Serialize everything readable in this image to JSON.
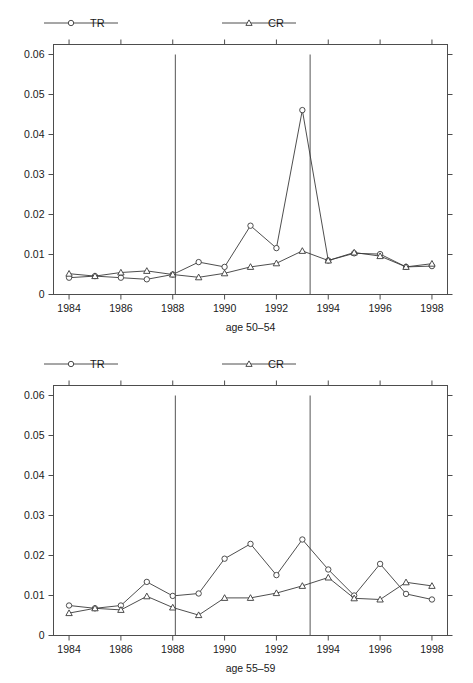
{
  "figure": {
    "background": "#ffffff",
    "line_color": "#3a3a3a",
    "axis_color": "#4d4d4d",
    "text_color": "#1a1a1a"
  },
  "legend": {
    "series": [
      {
        "key": "TR",
        "label": "TR",
        "marker": "circle"
      },
      {
        "key": "CR",
        "label": "CR",
        "marker": "triangle"
      }
    ]
  },
  "chart_data": [
    {
      "id": "age-50-54",
      "type": "line",
      "title": "",
      "xlabel": "age 50–54",
      "ylabel": "",
      "xlim": [
        1983.4,
        1998.6
      ],
      "ylim": [
        0,
        0.0625
      ],
      "xticks": [
        1984,
        1986,
        1988,
        1990,
        1992,
        1994,
        1996,
        1998
      ],
      "xticklabels": [
        "1984",
        "1986",
        "1988",
        "1990",
        "1992",
        "1994",
        "1996",
        "1998"
      ],
      "yticks": [
        0,
        0.01,
        0.02,
        0.03,
        0.04,
        0.05,
        0.06
      ],
      "yticklabels": [
        "0",
        "0.01",
        "0.02",
        "0.03",
        "0.04",
        "0.05",
        "0.06"
      ],
      "grid": false,
      "legend_position": "above-plot",
      "vlines": [
        1988.1,
        1993.3
      ],
      "x": [
        1984,
        1985,
        1986,
        1987,
        1988,
        1989,
        1990,
        1991,
        1992,
        1993,
        1994,
        1995,
        1996,
        1997,
        1998
      ],
      "series": [
        {
          "name": "TR",
          "marker": "circle",
          "values": [
            0.0042,
            0.0046,
            0.0042,
            0.0038,
            0.005,
            0.0081,
            0.0069,
            0.0172,
            0.0116,
            0.0461,
            0.0085,
            0.0103,
            0.0101,
            0.0069,
            0.0071
          ]
        },
        {
          "name": "CR",
          "marker": "triangle",
          "values": [
            0.0052,
            0.0046,
            0.0055,
            0.0059,
            0.005,
            0.0043,
            0.0053,
            0.0069,
            0.0078,
            0.0109,
            0.0085,
            0.0105,
            0.0096,
            0.0069,
            0.0077
          ]
        }
      ]
    },
    {
      "id": "age-55-59",
      "type": "line",
      "title": "",
      "xlabel": "age 55–59",
      "ylabel": "",
      "xlim": [
        1983.4,
        1998.6
      ],
      "ylim": [
        0,
        0.0625
      ],
      "xticks": [
        1984,
        1986,
        1988,
        1990,
        1992,
        1994,
        1996,
        1998
      ],
      "xticklabels": [
        "1984",
        "1986",
        "1988",
        "1990",
        "1992",
        "1994",
        "1996",
        "1998"
      ],
      "yticks": [
        0,
        0.01,
        0.02,
        0.03,
        0.04,
        0.05,
        0.06
      ],
      "yticklabels": [
        "0",
        "0.01",
        "0.02",
        "0.03",
        "0.04",
        "0.05",
        "0.06"
      ],
      "grid": false,
      "legend_position": "above-plot",
      "vlines": [
        1988.1,
        1993.3
      ],
      "x": [
        1984,
        1985,
        1986,
        1987,
        1988,
        1989,
        1990,
        1991,
        1992,
        1993,
        1994,
        1995,
        1996,
        1997,
        1998
      ],
      "series": [
        {
          "name": "TR",
          "marker": "circle",
          "values": [
            0.0075,
            0.0068,
            0.0075,
            0.0134,
            0.0099,
            0.0105,
            0.0192,
            0.0229,
            0.0151,
            0.024,
            0.0165,
            0.01,
            0.0179,
            0.0104,
            0.009
          ]
        },
        {
          "name": "CR",
          "marker": "triangle",
          "values": [
            0.0056,
            0.0068,
            0.0064,
            0.0098,
            0.007,
            0.0051,
            0.0094,
            0.0094,
            0.0106,
            0.0124,
            0.0145,
            0.0093,
            0.009,
            0.0133,
            0.0124
          ]
        }
      ]
    }
  ]
}
